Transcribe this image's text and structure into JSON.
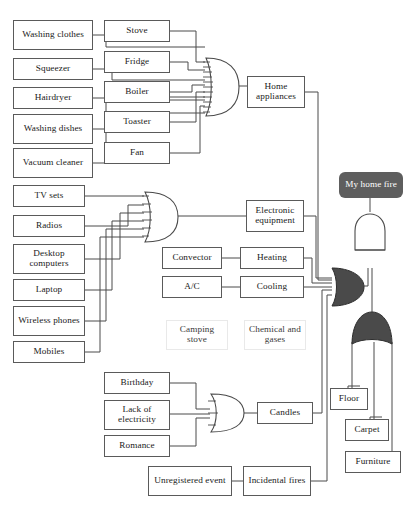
{
  "diagram": {
    "colors": {
      "box_border": "#5a5a5a",
      "ghost_border": "#e9e9e9",
      "wire": "#4a4a4a",
      "gate_light_fill": "#ffffff",
      "gate_light_stroke": "#4a4a4a",
      "gate_dark_fill": "#4a4a4a",
      "gate_dark_stroke": "#2e2e2e",
      "top_event_fill": "#5e5e5e",
      "top_event_text": "#ffffff",
      "background": "#ffffff"
    }
  },
  "top_event": {
    "label": "My home fire"
  },
  "nodes": {
    "washing_clothes": "Washing clothes",
    "squeezer": "Squeezer",
    "hairdryer": "Hairdryer",
    "washing_dishes": "Washing dishes",
    "vacuum_cleaner": "Vacuum cleaner",
    "stove": "Stove",
    "fridge": "Fridge",
    "boiler": "Boiler",
    "toaster": "Toaster",
    "fan": "Fan",
    "home_appliances": "Home appliances",
    "tv_sets": "TV sets",
    "radios": "Radios",
    "desktop_computers": "Desktop computers",
    "laptop": "Laptop",
    "wireless_phones": "Wireless phones",
    "mobiles": "Mobiles",
    "electronic_equipment": "Electronic equipment",
    "convector": "Convector",
    "heating": "Heating",
    "ac": "A/C",
    "cooling": "Cooling",
    "camping_stove": "Camping stove",
    "chemical_and_gases": "Chemical and gases",
    "birthday": "Birthday",
    "lack_of_electricity": "Lack of electricity",
    "romance": "Romance",
    "candles": "Candles",
    "unregistered_event": "Unregistered event",
    "incidental_fires": "Incidental fires",
    "floor": "Floor",
    "carpet": "Carpet",
    "furniture": "Furniture"
  },
  "gates": [
    {
      "id": "or-home-appliances",
      "type": "OR",
      "style": "light",
      "orientation": "right",
      "inputs": [
        "washing_clothes",
        "squeezer",
        "hairdryer",
        "washing_dishes",
        "vacuum_cleaner",
        "stove",
        "fridge",
        "boiler",
        "toaster",
        "fan"
      ],
      "output": "home_appliances"
    },
    {
      "id": "or-electronic-equipment",
      "type": "OR",
      "style": "light",
      "orientation": "right",
      "inputs": [
        "tv_sets",
        "radios",
        "desktop_computers",
        "laptop",
        "wireless_phones",
        "mobiles"
      ],
      "output": "electronic_equipment"
    },
    {
      "id": "or-candles",
      "type": "OR",
      "style": "light",
      "orientation": "right",
      "inputs": [
        "birthday",
        "lack_of_electricity",
        "romance"
      ],
      "output": "candles"
    },
    {
      "id": "or-ignition-sources",
      "type": "OR",
      "style": "dark",
      "orientation": "right",
      "inputs": [
        "home_appliances",
        "electronic_equipment",
        "heating",
        "cooling",
        "candles",
        "incidental_fires"
      ],
      "output": "and-top"
    },
    {
      "id": "or-combustibles",
      "type": "OR",
      "style": "dark",
      "orientation": "up",
      "inputs": [
        "floor",
        "carpet",
        "furniture"
      ],
      "output": "and-top"
    },
    {
      "id": "and-top",
      "type": "AND",
      "style": "light",
      "orientation": "up",
      "inputs": [
        "or-ignition-sources",
        "or-combustibles"
      ],
      "output": "top_event"
    }
  ],
  "edges": [
    {
      "from": "convector",
      "to": "heating"
    },
    {
      "from": "ac",
      "to": "cooling"
    },
    {
      "from": "unregistered_event",
      "to": "incidental_fires"
    }
  ]
}
